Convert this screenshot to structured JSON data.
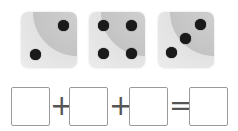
{
  "dice": [
    {
      "value": 2
    },
    {
      "value": 4
    },
    {
      "value": 3
    }
  ],
  "equation": {
    "boxes": [
      "",
      "",
      "",
      ""
    ],
    "operators": [
      "+",
      "+",
      "="
    ]
  }
}
